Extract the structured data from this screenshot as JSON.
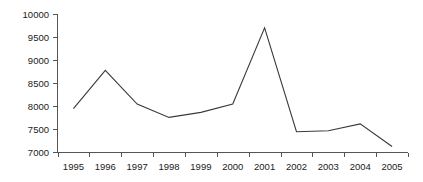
{
  "chart_data": {
    "type": "line",
    "title": "",
    "subtitle": "",
    "xlabel": "",
    "ylabel": "",
    "categories": [
      "1995",
      "1996",
      "1997",
      "1998",
      "1999",
      "2000",
      "2001",
      "2002",
      "2003",
      "2004",
      "2005"
    ],
    "x": [
      1995,
      1996,
      1997,
      1998,
      1999,
      2000,
      2001,
      2002,
      2003,
      2004,
      2005
    ],
    "values": [
      7950,
      8780,
      8050,
      7760,
      7870,
      8050,
      9700,
      7450,
      7470,
      7620,
      7130
    ],
    "series": [
      {
        "name": "",
        "values": [
          7950,
          8780,
          8050,
          7760,
          7870,
          8050,
          9700,
          7450,
          7470,
          7620,
          7130
        ]
      }
    ],
    "ylim": [
      7000,
      10000
    ],
    "ytick_labels": [
      "7000",
      "7500",
      "8000",
      "8500",
      "9000",
      "9500",
      "10000"
    ],
    "ytick_values": [
      7000,
      7500,
      8000,
      8500,
      9000,
      9500,
      10000
    ],
    "xtick_labels": [
      "1995",
      "1996",
      "1997",
      "1998",
      "1999",
      "2000",
      "2001",
      "2002",
      "2003",
      "2004",
      "2005"
    ],
    "grid": false,
    "legend": false,
    "legend_position": "none",
    "line_color": "#3a3a3a",
    "axis_color": "#555555",
    "background_color": "#ffffff",
    "text_color": "#1a1a1a",
    "markers": false
  }
}
